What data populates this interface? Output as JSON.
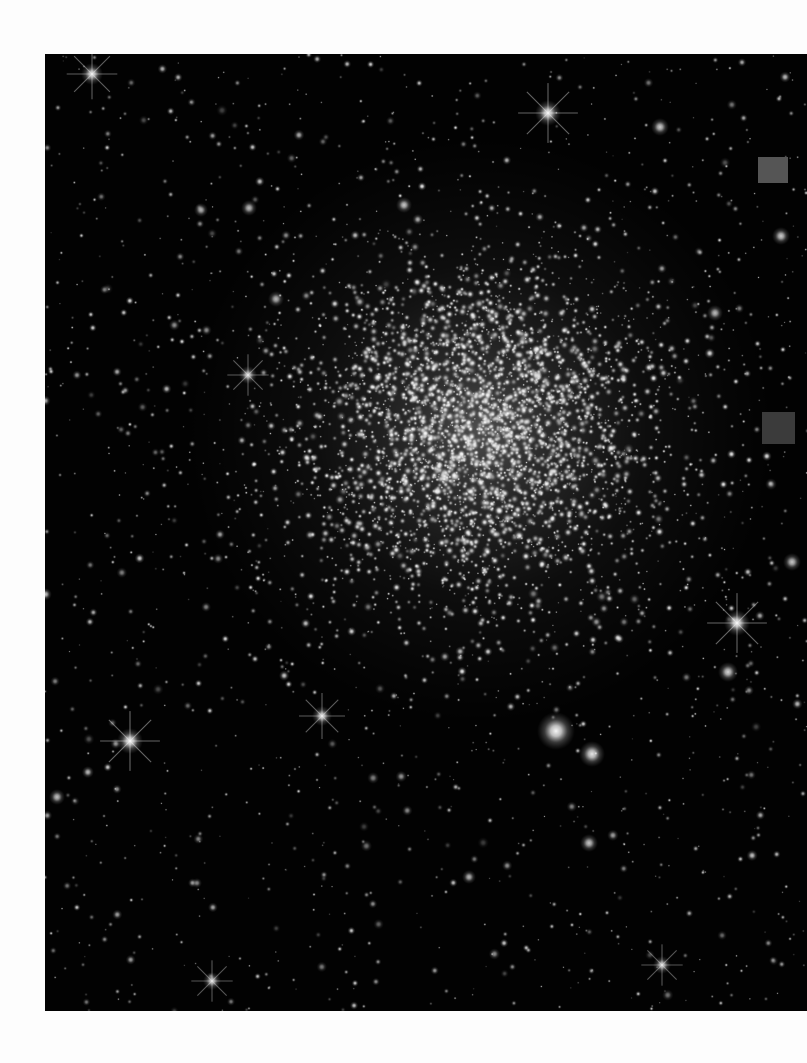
{
  "page": {
    "background_color": "#fdfdfd",
    "width": 807,
    "height": 1063
  },
  "astro_image": {
    "kind": "telescope-photograph",
    "subject": "globular-star-cluster",
    "description": "Dense globular cluster: a bright unresolved concentration of stars at the center fading into a sparse surrounding star field on a black sky background.",
    "frame": {
      "x": 45,
      "y": 54,
      "width": 762,
      "height": 957,
      "cropped_edges": [
        "right"
      ],
      "sky_color": "#020202",
      "star_color": "#ffffff"
    },
    "cluster_core": {
      "center_x": 480,
      "center_y": 430,
      "core_radius": 110,
      "halo_radius": 300,
      "peak_brightness": 0.95
    },
    "markers": [
      {
        "name": "upper-gray-marker",
        "x": 758,
        "y": 157,
        "width": 30,
        "height": 26,
        "color": "#555555"
      },
      {
        "name": "lower-gray-marker",
        "x": 762,
        "y": 412,
        "width": 33,
        "height": 32,
        "color": "#3b3b3b"
      }
    ],
    "bright_stars": [
      {
        "x": 92,
        "y": 74,
        "radius": 11,
        "brightness": 0.88,
        "spikes": true
      },
      {
        "x": 548,
        "y": 113,
        "radius": 13,
        "brightness": 0.92,
        "spikes": true
      },
      {
        "x": 404,
        "y": 205,
        "radius": 8,
        "brightness": 0.78,
        "spikes": false
      },
      {
        "x": 249,
        "y": 208,
        "radius": 8,
        "brightness": 0.74,
        "spikes": false
      },
      {
        "x": 660,
        "y": 127,
        "radius": 9,
        "brightness": 0.8,
        "spikes": false
      },
      {
        "x": 248,
        "y": 375,
        "radius": 9,
        "brightness": 0.82,
        "spikes": true
      },
      {
        "x": 201,
        "y": 210,
        "radius": 7,
        "brightness": 0.7,
        "spikes": false
      },
      {
        "x": 276,
        "y": 299,
        "radius": 8,
        "brightness": 0.72,
        "spikes": false
      },
      {
        "x": 737,
        "y": 623,
        "radius": 13,
        "brightness": 0.94,
        "spikes": true
      },
      {
        "x": 728,
        "y": 672,
        "radius": 10,
        "brightness": 0.84,
        "spikes": false
      },
      {
        "x": 130,
        "y": 741,
        "radius": 13,
        "brightness": 0.95,
        "spikes": true
      },
      {
        "x": 322,
        "y": 716,
        "radius": 10,
        "brightness": 0.86,
        "spikes": true
      },
      {
        "x": 556,
        "y": 731,
        "radius": 19,
        "brightness": 0.97,
        "spikes": false
      },
      {
        "x": 592,
        "y": 754,
        "radius": 13,
        "brightness": 0.9,
        "spikes": false
      },
      {
        "x": 57,
        "y": 797,
        "radius": 8,
        "brightness": 0.76,
        "spikes": false
      },
      {
        "x": 589,
        "y": 843,
        "radius": 9,
        "brightness": 0.78,
        "spikes": false
      },
      {
        "x": 212,
        "y": 981,
        "radius": 9,
        "brightness": 0.8,
        "spikes": true
      },
      {
        "x": 662,
        "y": 965,
        "radius": 9,
        "brightness": 0.8,
        "spikes": true
      },
      {
        "x": 469,
        "y": 877,
        "radius": 7,
        "brightness": 0.72,
        "spikes": false
      },
      {
        "x": 781,
        "y": 236,
        "radius": 9,
        "brightness": 0.8,
        "spikes": false
      },
      {
        "x": 715,
        "y": 313,
        "radius": 8,
        "brightness": 0.74,
        "spikes": false
      },
      {
        "x": 792,
        "y": 562,
        "radius": 9,
        "brightness": 0.78,
        "spikes": false
      }
    ],
    "field_star_counts": {
      "dense_core_points": 2600,
      "halo_points": 1500,
      "sparse_field_points": 1400
    }
  }
}
